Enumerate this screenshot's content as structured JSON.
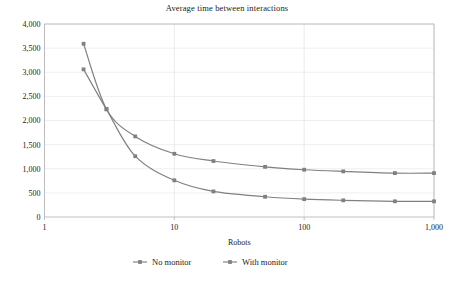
{
  "chart_data": {
    "type": "line",
    "title": "Average time between interactions",
    "xlabel": "Robots",
    "ylabel": "",
    "xscale": "log",
    "xlim": [
      1,
      1000
    ],
    "ylim": [
      0,
      4000
    ],
    "grid": true,
    "legend_position": "bottom",
    "x_tick_labels": [
      "1",
      "10",
      "100",
      "1,000"
    ],
    "x_tick_values": [
      1,
      10,
      100,
      1000
    ],
    "y_tick_labels": [
      "0",
      "500",
      "1,000",
      "1,500",
      "2,000",
      "2,500",
      "3,000",
      "3,500",
      "4,000"
    ],
    "y_tick_values": [
      0,
      500,
      1000,
      1500,
      2000,
      2500,
      3000,
      3500,
      4000
    ],
    "x": [
      2,
      3,
      5,
      10,
      20,
      50,
      100,
      200,
      500,
      1000
    ],
    "series": [
      {
        "name": "No monitor",
        "color": "#808080",
        "values": [
          3060,
          2230,
          1260,
          760,
          530,
          420,
          370,
          345,
          325,
          325
        ]
      },
      {
        "name": "With monitor",
        "color": "#808080",
        "values": [
          3590,
          2240,
          1670,
          1310,
          1160,
          1040,
          980,
          945,
          910,
          910
        ]
      }
    ]
  },
  "legend": {
    "items": [
      {
        "label": "No monitor"
      },
      {
        "label": "With monitor"
      }
    ]
  }
}
